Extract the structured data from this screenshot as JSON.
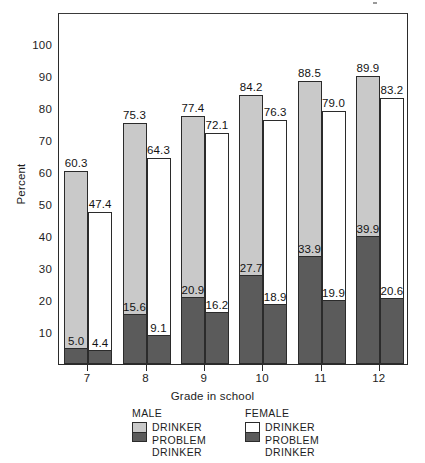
{
  "chart_data": {
    "type": "bar",
    "title": "",
    "subtitle": "",
    "xlabel": "Grade in school",
    "ylabel": "Percent",
    "categories": [
      "7",
      "8",
      "9",
      "10",
      "11",
      "12"
    ],
    "ylim": [
      0,
      110
    ],
    "yticks": [
      10,
      20,
      30,
      40,
      50,
      60,
      70,
      80,
      90,
      100
    ],
    "ytick_labels": [
      "10",
      "20",
      "30",
      "40",
      "50",
      "60",
      "70",
      "80",
      "90",
      "100"
    ],
    "grid": false,
    "legend_position": "bottom",
    "stacked": true,
    "series": [
      {
        "name": "MALE DRINKER",
        "group": "MALE",
        "role": "drinker",
        "color": "#c9c9c9",
        "values": [
          60.3,
          75.3,
          77.4,
          84.2,
          88.5,
          89.9
        ],
        "labels": [
          "60.3",
          "75.3",
          "77.4",
          "84.2",
          "88.5",
          "89.9"
        ]
      },
      {
        "name": "MALE PROBLEM DRINKER",
        "group": "MALE",
        "role": "problem",
        "color": "#5b5b5b",
        "values": [
          5.0,
          15.6,
          20.9,
          27.7,
          33.9,
          39.9
        ],
        "labels": [
          "5.0",
          "15.6",
          "20.9",
          "27.7",
          "33.9",
          "39.9"
        ]
      },
      {
        "name": "FEMALE DRINKER",
        "group": "FEMALE",
        "role": "drinker",
        "color": "#ffffff",
        "values": [
          47.4,
          64.3,
          72.1,
          76.3,
          79.0,
          83.2
        ],
        "labels": [
          "47.4",
          "64.3",
          "72.1",
          "76.3",
          "79.0",
          "83.2"
        ]
      },
      {
        "name": "FEMALE PROBLEM DRINKER",
        "group": "FEMALE",
        "role": "problem",
        "color": "#5b5b5b",
        "values": [
          4.4,
          9.1,
          16.2,
          18.9,
          19.9,
          20.6
        ],
        "labels": [
          "4.4",
          "9.1",
          "16.2",
          "18.9",
          "19.9",
          "20.6"
        ]
      }
    ],
    "annotations": []
  },
  "axes": {
    "y_title": "Percent",
    "x_title": "Grade in school"
  },
  "legend": {
    "groups": [
      {
        "heading": "MALE",
        "entries": [
          {
            "swatch": "male",
            "lines": [
              "DRINKER"
            ]
          },
          {
            "swatch": "male-problem",
            "lines": [
              "PROBLEM",
              "DRINKER"
            ]
          }
        ],
        "line1": "DRINKER",
        "line2": "PROBLEM",
        "line3": "DRINKER"
      },
      {
        "heading": "FEMALE",
        "entries": [
          {
            "swatch": "female",
            "lines": [
              "DRINKER"
            ]
          },
          {
            "swatch": "female-problem",
            "lines": [
              "PROBLEM",
              "DRINKER"
            ]
          }
        ],
        "line1": "DRINKER",
        "line2": "PROBLEM",
        "line3": "DRINKER"
      }
    ]
  },
  "colors": {
    "male_drinker": "#c9c9c9",
    "problem_drinker": "#5b5b5b",
    "female_drinker": "#ffffff",
    "axis": "#2b2b2b",
    "text": "#1d1d1d",
    "background": "#ffffff"
  }
}
